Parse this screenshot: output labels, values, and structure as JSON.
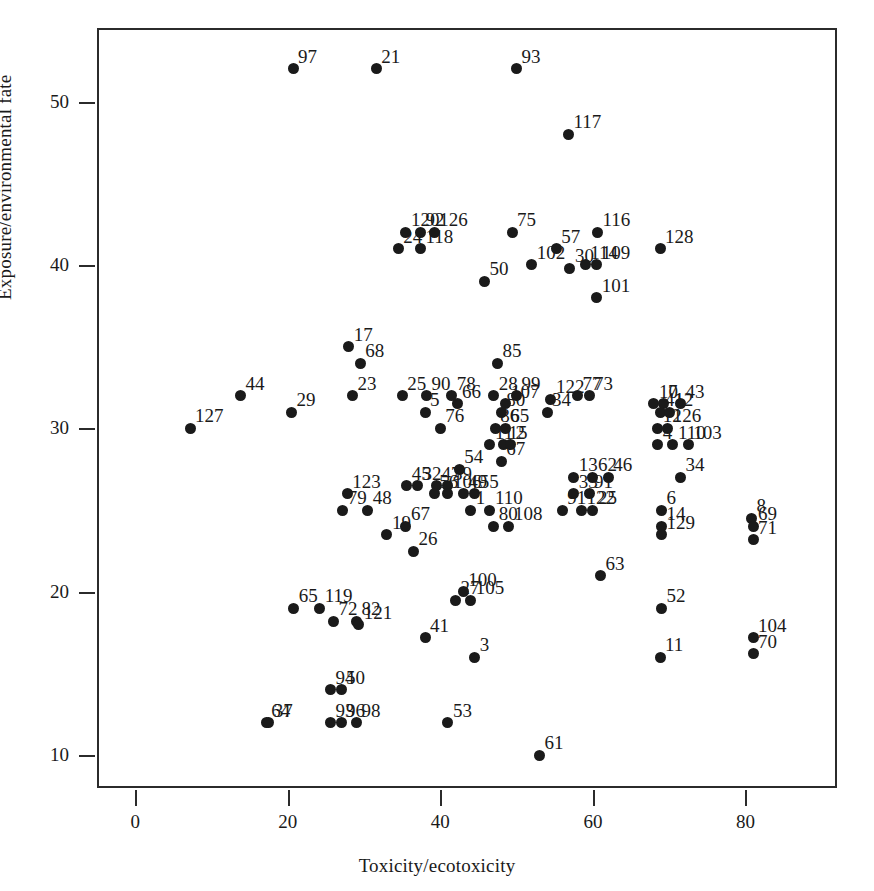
{
  "chart_data": {
    "type": "scatter",
    "title": "",
    "xlabel": "Toxicity/ecotoxicity",
    "ylabel": "Exposure/environmental fate",
    "xlim": [
      -5,
      92
    ],
    "ylim": [
      8.0,
      54.5
    ],
    "xticks": [
      0,
      20,
      40,
      60,
      80
    ],
    "yticks": [
      10,
      20,
      30,
      40,
      50
    ],
    "grid": false,
    "legend": null,
    "marker": "filled-circle",
    "marker_color": "#1a1a1a",
    "point_labels_shown": true,
    "n_points": 129,
    "points": [
      {
        "label": "97",
        "x": 20.7,
        "y": 52.0
      },
      {
        "label": "21",
        "x": 31.6,
        "y": 52.0
      },
      {
        "label": "93",
        "x": 50.0,
        "y": 52.0
      },
      {
        "label": "117",
        "x": 56.8,
        "y": 48.0
      },
      {
        "label": "120",
        "x": 35.5,
        "y": 42.0
      },
      {
        "label": "92",
        "x": 37.4,
        "y": 42.0
      },
      {
        "label": "126",
        "x": 39.2,
        "y": 42.0
      },
      {
        "label": "75",
        "x": 49.4,
        "y": 42.0
      },
      {
        "label": "116",
        "x": 60.6,
        "y": 42.0
      },
      {
        "label": "24",
        "x": 34.5,
        "y": 41.0
      },
      {
        "label": "118",
        "x": 37.4,
        "y": 41.0
      },
      {
        "label": "57",
        "x": 55.2,
        "y": 41.0
      },
      {
        "label": "128",
        "x": 68.8,
        "y": 41.0
      },
      {
        "label": "102",
        "x": 52.0,
        "y": 40.0
      },
      {
        "label": "114",
        "x": 59.0,
        "y": 40.0
      },
      {
        "label": "109",
        "x": 60.5,
        "y": 40.0
      },
      {
        "label": "30",
        "x": 57.0,
        "y": 39.8
      },
      {
        "label": "50",
        "x": 45.8,
        "y": 39.0
      },
      {
        "label": "101",
        "x": 60.5,
        "y": 38.0
      },
      {
        "label": "17",
        "x": 28.0,
        "y": 35.0
      },
      {
        "label": "68",
        "x": 29.5,
        "y": 34.0
      },
      {
        "label": "85",
        "x": 47.5,
        "y": 34.0
      },
      {
        "label": "44",
        "x": 13.8,
        "y": 32.0
      },
      {
        "label": "29",
        "x": 20.5,
        "y": 31.0
      },
      {
        "label": "23",
        "x": 28.5,
        "y": 32.0
      },
      {
        "label": "25",
        "x": 35.0,
        "y": 32.0
      },
      {
        "label": "90",
        "x": 38.2,
        "y": 32.0
      },
      {
        "label": "78",
        "x": 41.5,
        "y": 32.0
      },
      {
        "label": "28",
        "x": 47.0,
        "y": 32.0
      },
      {
        "label": "99",
        "x": 50.0,
        "y": 32.0
      },
      {
        "label": "77",
        "x": 58.0,
        "y": 32.0
      },
      {
        "label": "73",
        "x": 59.5,
        "y": 32.0
      },
      {
        "label": "66",
        "x": 42.2,
        "y": 31.5
      },
      {
        "label": "107",
        "x": 48.6,
        "y": 31.5
      },
      {
        "label": "122",
        "x": 54.5,
        "y": 31.8
      },
      {
        "label": "127",
        "x": 7.2,
        "y": 30.0
      },
      {
        "label": "5",
        "x": 38.0,
        "y": 31.0
      },
      {
        "label": "80",
        "x": 48.0,
        "y": 31.0
      },
      {
        "label": "34",
        "x": 54.0,
        "y": 31.0
      },
      {
        "label": "10",
        "x": 68.0,
        "y": 31.5
      },
      {
        "label": "7",
        "x": 69.2,
        "y": 31.5
      },
      {
        "label": "43",
        "x": 71.5,
        "y": 31.5
      },
      {
        "label": "41",
        "x": 68.8,
        "y": 31.0
      },
      {
        "label": "12",
        "x": 70.0,
        "y": 31.0
      },
      {
        "label": "76",
        "x": 40.0,
        "y": 30.0
      },
      {
        "label": "86",
        "x": 47.2,
        "y": 30.0
      },
      {
        "label": "65",
        "x": 48.5,
        "y": 30.0
      },
      {
        "label": "12b",
        "x": 68.5,
        "y": 30.0
      },
      {
        "label": "126b",
        "x": 69.8,
        "y": 30.0
      },
      {
        "label": "11",
        "x": 46.5,
        "y": 29.0
      },
      {
        "label": "15",
        "x": 48.3,
        "y": 29.0
      },
      {
        "label": "2",
        "x": 49.2,
        "y": 29.0
      },
      {
        "label": "4",
        "x": 68.5,
        "y": 29.0
      },
      {
        "label": "110",
        "x": 70.5,
        "y": 29.0
      },
      {
        "label": "103",
        "x": 72.5,
        "y": 29.0
      },
      {
        "label": "67",
        "x": 48.0,
        "y": 28.0
      },
      {
        "label": "54",
        "x": 42.5,
        "y": 27.5
      },
      {
        "label": "13",
        "x": 57.5,
        "y": 27.0
      },
      {
        "label": "62",
        "x": 60.0,
        "y": 27.0
      },
      {
        "label": "46",
        "x": 62.0,
        "y": 27.0
      },
      {
        "label": "34b",
        "x": 71.5,
        "y": 27.0
      },
      {
        "label": "45",
        "x": 35.6,
        "y": 26.5
      },
      {
        "label": "32",
        "x": 37.0,
        "y": 26.5
      },
      {
        "label": "47",
        "x": 39.5,
        "y": 26.5
      },
      {
        "label": "39",
        "x": 41.0,
        "y": 26.5
      },
      {
        "label": "123",
        "x": 27.8,
        "y": 26.0
      },
      {
        "label": "79",
        "x": 27.2,
        "y": 25.0
      },
      {
        "label": "48",
        "x": 30.5,
        "y": 25.0
      },
      {
        "label": "56",
        "x": 39.2,
        "y": 26.0
      },
      {
        "label": "106",
        "x": 41.0,
        "y": 26.0
      },
      {
        "label": "49",
        "x": 43.0,
        "y": 26.0
      },
      {
        "label": "55",
        "x": 44.5,
        "y": 26.0
      },
      {
        "label": "33",
        "x": 57.5,
        "y": 26.0
      },
      {
        "label": "91",
        "x": 59.5,
        "y": 26.0
      },
      {
        "label": "1",
        "x": 44.0,
        "y": 25.0
      },
      {
        "label": "110b",
        "x": 46.5,
        "y": 25.0
      },
      {
        "label": "91b",
        "x": 56.0,
        "y": 25.0
      },
      {
        "label": "122b",
        "x": 58.5,
        "y": 25.0
      },
      {
        "label": "25b",
        "x": 60.0,
        "y": 25.0
      },
      {
        "label": "6",
        "x": 69.0,
        "y": 25.0
      },
      {
        "label": "8",
        "x": 80.8,
        "y": 24.5
      },
      {
        "label": "19",
        "x": 33.0,
        "y": 23.5
      },
      {
        "label": "67b",
        "x": 35.5,
        "y": 24.0
      },
      {
        "label": "80b",
        "x": 47.0,
        "y": 24.0
      },
      {
        "label": "108",
        "x": 49.0,
        "y": 24.0
      },
      {
        "label": "14",
        "x": 69.0,
        "y": 24.0
      },
      {
        "label": "69",
        "x": 81.0,
        "y": 24.0
      },
      {
        "label": "129",
        "x": 69.0,
        "y": 23.5
      },
      {
        "label": "71",
        "x": 81.0,
        "y": 23.2
      },
      {
        "label": "26",
        "x": 36.5,
        "y": 22.5
      },
      {
        "label": "63",
        "x": 61.0,
        "y": 21.0
      },
      {
        "label": "100",
        "x": 43.0,
        "y": 20.0
      },
      {
        "label": "27",
        "x": 42.0,
        "y": 19.5
      },
      {
        "label": "105",
        "x": 44.0,
        "y": 19.5
      },
      {
        "label": "65b",
        "x": 20.8,
        "y": 19.0
      },
      {
        "label": "119",
        "x": 24.2,
        "y": 19.0
      },
      {
        "label": "52",
        "x": 69.0,
        "y": 19.0
      },
      {
        "label": "72",
        "x": 26.0,
        "y": 18.2
      },
      {
        "label": "82",
        "x": 29.0,
        "y": 18.2
      },
      {
        "label": "121",
        "x": 29.3,
        "y": 18.0
      },
      {
        "label": "41b",
        "x": 38.0,
        "y": 17.2
      },
      {
        "label": "104",
        "x": 81.0,
        "y": 17.2
      },
      {
        "label": "70",
        "x": 81.0,
        "y": 16.2
      },
      {
        "label": "3",
        "x": 44.5,
        "y": 16.0
      },
      {
        "label": "11b",
        "x": 68.8,
        "y": 16.0
      },
      {
        "label": "94",
        "x": 25.6,
        "y": 14.0
      },
      {
        "label": "50b",
        "x": 27.0,
        "y": 14.0
      },
      {
        "label": "37",
        "x": 17.5,
        "y": 12.0
      },
      {
        "label": "64",
        "x": 17.2,
        "y": 12.0
      },
      {
        "label": "93b",
        "x": 25.6,
        "y": 12.0
      },
      {
        "label": "96",
        "x": 27.0,
        "y": 12.0
      },
      {
        "label": "98",
        "x": 29.0,
        "y": 12.0
      },
      {
        "label": "53",
        "x": 41.0,
        "y": 12.0
      },
      {
        "label": "61",
        "x": 53.0,
        "y": 10.0
      }
    ],
    "label_texts": [
      "97",
      "21",
      "93",
      "117",
      "120",
      "92",
      "126",
      "75",
      "116",
      "24",
      "118",
      "57",
      "128",
      "102",
      "114",
      "109",
      "30",
      "50",
      "101",
      "17",
      "68",
      "85",
      "44",
      "29",
      "23",
      "25",
      "90",
      "78",
      "28",
      "99",
      "77",
      "73",
      "66",
      "107",
      "122",
      "127",
      "5",
      "80",
      "34",
      "10",
      "7",
      "43",
      "41",
      "12",
      "76",
      "86",
      "65",
      "126",
      "11",
      "15",
      "2",
      "4",
      "110",
      "103",
      "67",
      "54",
      "13",
      "62",
      "46",
      "45",
      "32",
      "47",
      "39",
      "123",
      "79",
      "48",
      "56",
      "106",
      "49",
      "55",
      "33",
      "91",
      "1",
      "25",
      "6",
      "8",
      "19",
      "80",
      "108",
      "14",
      "69",
      "129",
      "71",
      "26",
      "63",
      "100",
      "27",
      "105",
      "119",
      "52",
      "72",
      "82",
      "121",
      "104",
      "70",
      "3",
      "94",
      "50",
      "37",
      "64",
      "96",
      "98",
      "53",
      "61",
      "123",
      "34"
    ]
  },
  "axes": {
    "x": {
      "label": "Toxicity/ecotoxicity",
      "ticks": [
        {
          "value": 0,
          "text": "0"
        },
        {
          "value": 20,
          "text": "20"
        },
        {
          "value": 40,
          "text": "40"
        },
        {
          "value": 60,
          "text": "60"
        },
        {
          "value": 80,
          "text": "80"
        }
      ]
    },
    "y": {
      "label": "Exposure/environmental fate",
      "ticks": [
        {
          "value": 10,
          "text": "10"
        },
        {
          "value": 20,
          "text": "20"
        },
        {
          "value": 30,
          "text": "30"
        },
        {
          "value": 40,
          "text": "40"
        },
        {
          "value": 50,
          "text": "50"
        }
      ]
    }
  },
  "style": {
    "marker_color": "#1a1a1a",
    "frame_color": "#2b2b2b",
    "background": "#ffffff"
  }
}
